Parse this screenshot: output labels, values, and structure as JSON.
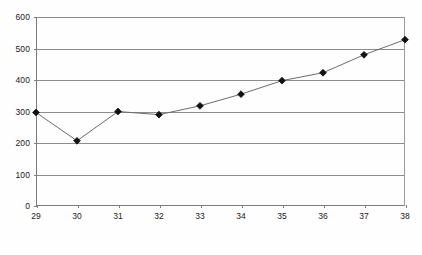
{
  "chart_data": {
    "type": "line",
    "title": "",
    "subtitle": "",
    "xlabel": "",
    "ylabel": "",
    "x": [
      29,
      30,
      31,
      32,
      33,
      34,
      35,
      36,
      37,
      38
    ],
    "values": [
      297,
      207,
      300,
      290,
      318,
      355,
      398,
      423,
      480,
      528
    ],
    "series": [
      {
        "name": "",
        "values": [
          297,
          207,
          300,
          290,
          318,
          355,
          398,
          423,
          480,
          528
        ]
      }
    ],
    "xlim": [
      29,
      38
    ],
    "ylim": [
      0,
      600
    ],
    "ytick_labels": [
      "0",
      "100",
      "200",
      "300",
      "400",
      "500",
      "600"
    ],
    "ytick_values": [
      0,
      100,
      200,
      300,
      400,
      500,
      600
    ],
    "xtick_labels": [
      "29",
      "30",
      "31",
      "32",
      "33",
      "34",
      "35",
      "36",
      "37",
      "38"
    ],
    "xtick_values": [
      29,
      30,
      31,
      32,
      33,
      34,
      35,
      36,
      37,
      38
    ],
    "grid": "horizontal",
    "legend": "none",
    "marker": "diamond",
    "colors": {
      "line": "#6b6b6b",
      "marker": "#111111",
      "grid": "#8d8d8d",
      "axis": "#7c7c7c",
      "background": "#fefefe",
      "text": "#1a1a1a"
    }
  }
}
